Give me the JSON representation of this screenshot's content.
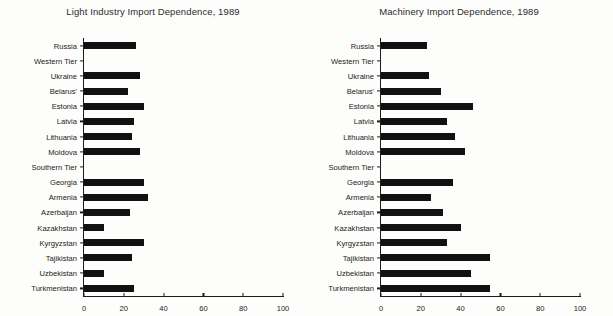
{
  "chart_data": [
    {
      "type": "bar",
      "orientation": "horizontal",
      "title": "Light Industry Import Dependence, 1989",
      "xlabel": "",
      "ylabel": "",
      "xlim": [
        0,
        100
      ],
      "xticks": [
        0,
        20,
        40,
        60,
        80,
        100
      ],
      "grid": false,
      "legend": "none",
      "categories": [
        "Russia",
        "Western Tier",
        "Ukraine",
        "Belarus'",
        "Estonia",
        "Latvia",
        "Lithuania",
        "Moldova",
        "Southern Tier",
        "Georgia",
        "Armenia",
        "Azerbaijan",
        "Kazakhstan",
        "Kyrgyzstan",
        "Tajikistan",
        "Uzbekistan",
        "Turkmenistan"
      ],
      "values": [
        26,
        null,
        28,
        22,
        30,
        25,
        24,
        28,
        null,
        30,
        32,
        23,
        10,
        30,
        24,
        10,
        25
      ]
    },
    {
      "type": "bar",
      "orientation": "horizontal",
      "title": "Machinery Import Dependence, 1989",
      "xlabel": "",
      "ylabel": "",
      "xlim": [
        0,
        100
      ],
      "xticks": [
        0,
        20,
        40,
        60,
        80,
        100
      ],
      "grid": false,
      "legend": "none",
      "categories": [
        "Russia",
        "Western Tier",
        "Ukraine",
        "Belarus'",
        "Estonia",
        "Latvia",
        "Lithuania",
        "Moldova",
        "Southern Tier",
        "Georgia",
        "Armenia",
        "Azerbaijan",
        "Kazakhstan",
        "Kyrgyzstan",
        "Tajikistan",
        "Uzbekistan",
        "Turkmenistan"
      ],
      "values": [
        23,
        null,
        24,
        30,
        46,
        33,
        37,
        42,
        null,
        36,
        25,
        31,
        40,
        33,
        55,
        45,
        55
      ]
    }
  ],
  "style": {
    "bar_color": "#111111",
    "axis_color": "#1d1d1d",
    "text_color": "#222222",
    "background": "#fdfdfb"
  }
}
